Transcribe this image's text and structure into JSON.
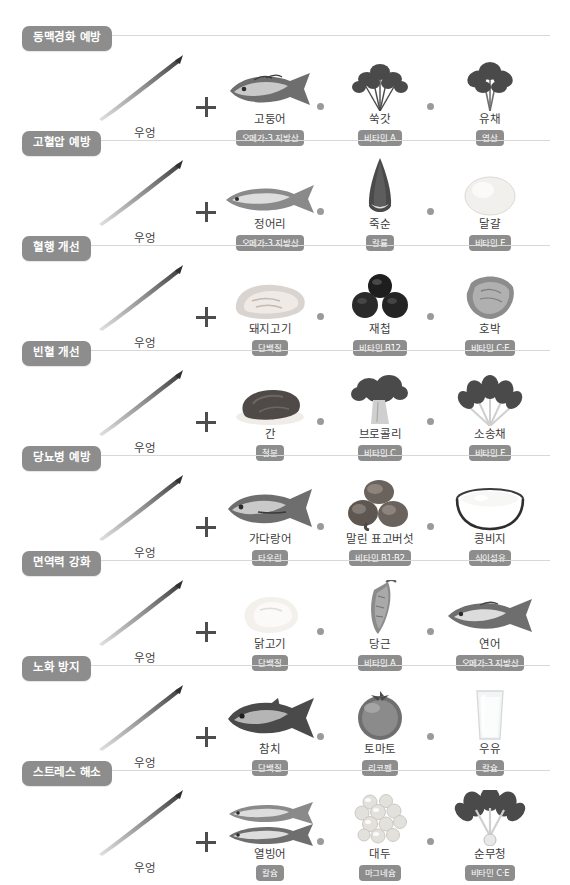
{
  "page": {
    "base_food": {
      "name": "우엉",
      "icon": "burdock-root-icon"
    },
    "plus_symbol": "+",
    "separator_symbol": "•"
  },
  "rows": [
    {
      "category": "동맥경화 예방",
      "items": [
        {
          "name": "고둥어",
          "nutrient": "오메가-3 지방산",
          "icon": "mackerel-fish-icon"
        },
        {
          "name": "쑥갓",
          "nutrient": "비타민 A",
          "icon": "crown-daisy-greens-icon"
        },
        {
          "name": "유채",
          "nutrient": "엽산",
          "icon": "rapeseed-greens-icon"
        }
      ]
    },
    {
      "category": "고혈압 예방",
      "items": [
        {
          "name": "정어리",
          "nutrient": "오메가-3 지방산",
          "icon": "sardine-fish-icon"
        },
        {
          "name": "죽순",
          "nutrient": "칼륨",
          "icon": "bamboo-shoot-icon"
        },
        {
          "name": "달걀",
          "nutrient": "비타민 E",
          "icon": "egg-icon"
        }
      ]
    },
    {
      "category": "혈행 개선",
      "items": [
        {
          "name": "돼지고기",
          "nutrient": "단백질",
          "icon": "pork-meat-icon"
        },
        {
          "name": "재첩",
          "nutrient": "비타민 B12",
          "icon": "marsh-clam-icon"
        },
        {
          "name": "호박",
          "nutrient": "비타민 C·E",
          "icon": "pumpkin-slice-icon"
        }
      ]
    },
    {
      "category": "빈혈 개선",
      "items": [
        {
          "name": "간",
          "nutrient": "철분",
          "icon": "liver-meat-icon"
        },
        {
          "name": "브로콜리",
          "nutrient": "비타민 C",
          "icon": "broccoli-icon"
        },
        {
          "name": "소송채",
          "nutrient": "비타민 E",
          "icon": "komatsuna-greens-icon"
        }
      ]
    },
    {
      "category": "당뇨병 예방",
      "items": [
        {
          "name": "가다랑어",
          "nutrient": "타우린",
          "icon": "bonito-fish-icon"
        },
        {
          "name": "말린 표고버섯",
          "nutrient": "비타민 B1·B2",
          "icon": "dried-shiitake-mushroom-icon"
        },
        {
          "name": "콩비지",
          "nutrient": "식이섬유",
          "icon": "okara-bowl-icon"
        }
      ]
    },
    {
      "category": "면역력 강화",
      "items": [
        {
          "name": "닭고기",
          "nutrient": "단백질",
          "icon": "chicken-meat-icon"
        },
        {
          "name": "당근",
          "nutrient": "비타민 A",
          "icon": "carrot-icon"
        },
        {
          "name": "연어",
          "nutrient": "오메가-3 지방산",
          "icon": "salmon-fish-icon"
        }
      ]
    },
    {
      "category": "노화 방지",
      "items": [
        {
          "name": "참치",
          "nutrient": "단백질",
          "icon": "tuna-fish-icon"
        },
        {
          "name": "토마토",
          "nutrient": "리코펜",
          "icon": "tomato-icon"
        },
        {
          "name": "우유",
          "nutrient": "칼슘",
          "icon": "milk-glass-icon"
        }
      ]
    },
    {
      "category": "스트레스 해소",
      "items": [
        {
          "name": "열빙어",
          "nutrient": "칼슘",
          "icon": "capelin-fish-icon"
        },
        {
          "name": "대두",
          "nutrient": "마그네슘",
          "icon": "soybeans-icon"
        },
        {
          "name": "순무청",
          "nutrient": "비타민 C·E",
          "icon": "turnip-greens-icon"
        }
      ]
    }
  ],
  "colors": {
    "tag_background": "#8d8d8d",
    "tag_text": "#ffffff",
    "divider": "#d8d8d8",
    "name_text": "#3c3c3c",
    "dot": "#9a9a9a",
    "background": "#ffffff"
  }
}
